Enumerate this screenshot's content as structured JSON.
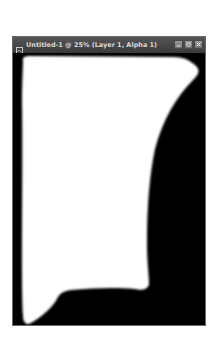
{
  "window": {
    "title": "Untitled-1 @ 25% (Layer 1, Alpha 1)",
    "buttons": [
      {
        "name": "minimize",
        "icon": "minimize-icon"
      },
      {
        "name": "maximize",
        "icon": "maximize-icon"
      },
      {
        "name": "close",
        "icon": "close-icon"
      }
    ]
  },
  "canvas": {
    "background_color": "#000000",
    "shape_color": "#ffffff",
    "zoom": "25%",
    "layer": "Layer 1",
    "channel": "Alpha 1"
  }
}
